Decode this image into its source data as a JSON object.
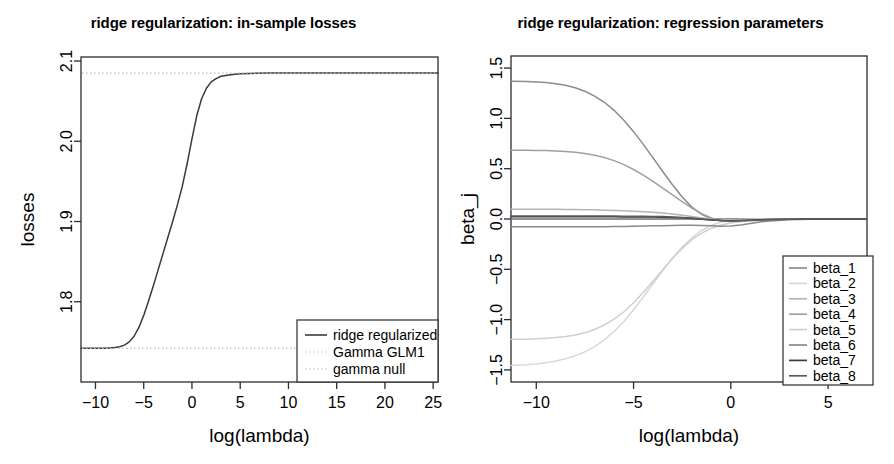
{
  "figure": {
    "background": "#ffffff",
    "foreground": "#000000",
    "panels": 2
  },
  "left_panel": {
    "title": "ridge regularization: in-sample losses",
    "xlabel": "log(lambda)",
    "ylabel": "losses",
    "legend": {
      "items": [
        {
          "label": "ridge regularized",
          "style": "solid",
          "color": "#3a3a3a"
        },
        {
          "label": "Gamma GLM1",
          "style": "dotted",
          "color": "#bdbdbd"
        },
        {
          "label": "gamma null",
          "style": "dotted",
          "color": "#bdbdbd"
        }
      ]
    }
  },
  "right_panel": {
    "title": "ridge regularization: regression parameters",
    "xlabel": "log(lambda)",
    "ylabel": "beta_j",
    "legend": {
      "items": [
        {
          "label": "beta_1",
          "color": "#8c8c8c"
        },
        {
          "label": "beta_2",
          "color": "#d8d8d8"
        },
        {
          "label": "beta_3",
          "color": "#b4b4b4"
        },
        {
          "label": "beta_4",
          "color": "#a0a0a0"
        },
        {
          "label": "beta_5",
          "color": "#cfcfcf"
        },
        {
          "label": "beta_6",
          "color": "#8a8a8a"
        },
        {
          "label": "beta_7",
          "color": "#3c3c3c"
        },
        {
          "label": "beta_8",
          "color": "#5a5a5a"
        }
      ]
    }
  },
  "chart_data": [
    {
      "id": "in-sample-losses",
      "type": "line",
      "title": "ridge regularization: in-sample losses",
      "xlabel": "log(lambda)",
      "ylabel": "losses",
      "grid": false,
      "legend_position": "bottom-right",
      "xlim": [
        -11.5,
        25.5
      ],
      "ylim": [
        1.7,
        2.105
      ],
      "xticks": [
        -10,
        -5,
        0,
        5,
        10,
        15,
        20,
        25
      ],
      "yticks": [
        1.8,
        1.9,
        2.0,
        2.1
      ],
      "ytick_labels": [
        "1.8",
        "1.9",
        "2.0",
        "2.1"
      ],
      "xtick_labels": [
        "-10",
        "-5",
        "0",
        "5",
        "10",
        "15",
        "20",
        "25"
      ],
      "series": [
        {
          "name": "ridge regularized",
          "style": "solid",
          "color": "#3a3a3a",
          "x": [
            -11.5,
            -11.0,
            -10.5,
            -10.0,
            -9.5,
            -9.0,
            -8.5,
            -8.0,
            -7.5,
            -7.0,
            -6.5,
            -6.0,
            -5.5,
            -5.0,
            -4.5,
            -4.0,
            -3.5,
            -3.0,
            -2.5,
            -2.0,
            -1.5,
            -1.0,
            -0.5,
            0.0,
            0.5,
            1.0,
            1.5,
            2.0,
            2.5,
            3.0,
            3.5,
            4.0,
            5.0,
            6.0,
            8.0,
            10.0,
            14.0,
            18.0,
            22.0,
            25.5
          ],
          "y": [
            1.742,
            1.742,
            1.742,
            1.742,
            1.742,
            1.742,
            1.7425,
            1.743,
            1.744,
            1.746,
            1.75,
            1.757,
            1.768,
            1.783,
            1.801,
            1.82,
            1.84,
            1.86,
            1.88,
            1.9,
            1.921,
            1.944,
            1.972,
            2.003,
            2.032,
            2.053,
            2.066,
            2.074,
            2.078,
            2.081,
            2.082,
            2.083,
            2.084,
            2.0845,
            2.085,
            2.085,
            2.085,
            2.085,
            2.085,
            2.085
          ]
        },
        {
          "name": "Gamma GLM1",
          "style": "dotted",
          "color": "#bdbdbd",
          "constant_y": 1.742,
          "description": "horizontal dotted reference line at lower asymptote"
        },
        {
          "name": "gamma null",
          "style": "dotted",
          "color": "#bdbdbd",
          "constant_y": 2.085,
          "description": "horizontal dotted reference line at upper asymptote"
        }
      ]
    },
    {
      "id": "regression-parameters",
      "type": "line",
      "title": "ridge regularization: regression parameters",
      "xlabel": "log(lambda)",
      "ylabel": "beta_j",
      "grid": false,
      "legend_position": "bottom-right",
      "xlim": [
        -11.3,
        7.0
      ],
      "ylim": [
        -1.62,
        1.62
      ],
      "xticks": [
        -10,
        -5,
        0,
        5
      ],
      "xtick_labels": [
        "-10",
        "-5",
        "0",
        "5"
      ],
      "yticks": [
        -1.5,
        -1.0,
        -0.5,
        0.0,
        0.5,
        1.0,
        1.5
      ],
      "ytick_labels": [
        "-1.5",
        "-1.0",
        "-0.5",
        "0.0",
        "0.5",
        "1.0",
        "1.5"
      ],
      "zero_line": true,
      "x": [
        -11.3,
        -10.5,
        -10.0,
        -9.5,
        -9.0,
        -8.5,
        -8.0,
        -7.5,
        -7.0,
        -6.5,
        -6.0,
        -5.5,
        -5.0,
        -4.5,
        -4.0,
        -3.5,
        -3.0,
        -2.5,
        -2.0,
        -1.5,
        -1.0,
        -0.5,
        0.0,
        0.5,
        1.0,
        1.5,
        2.0,
        3.0,
        4.0,
        5.0,
        6.0,
        7.0
      ],
      "series": [
        {
          "name": "beta_1",
          "color": "#8c8c8c",
          "values": [
            1.368,
            1.366,
            1.362,
            1.356,
            1.345,
            1.33,
            1.305,
            1.27,
            1.222,
            1.16,
            1.08,
            0.982,
            0.868,
            0.742,
            0.608,
            0.472,
            0.34,
            0.218,
            0.118,
            0.046,
            0.002,
            -0.018,
            -0.022,
            -0.018,
            -0.012,
            -0.007,
            -0.004,
            -0.001,
            0.0,
            0.0,
            0.0,
            0.0
          ]
        },
        {
          "name": "beta_2",
          "color": "#d8d8d8",
          "values": [
            -1.455,
            -1.448,
            -1.44,
            -1.428,
            -1.412,
            -1.39,
            -1.36,
            -1.32,
            -1.268,
            -1.2,
            -1.118,
            -1.018,
            -0.902,
            -0.776,
            -0.644,
            -0.512,
            -0.388,
            -0.278,
            -0.186,
            -0.114,
            -0.062,
            -0.03,
            -0.013,
            -0.005,
            -0.002,
            -0.001,
            0.0,
            0.0,
            0.0,
            0.0,
            0.0,
            0.0
          ]
        },
        {
          "name": "beta_3",
          "color": "#b4b4b4",
          "values": [
            0.096,
            0.096,
            0.096,
            0.096,
            0.096,
            0.095,
            0.094,
            0.093,
            0.091,
            0.088,
            0.085,
            0.081,
            0.077,
            0.072,
            0.066,
            0.059,
            0.05,
            0.038,
            0.024,
            0.01,
            -0.002,
            -0.009,
            -0.011,
            -0.009,
            -0.006,
            -0.004,
            -0.002,
            -0.001,
            0.0,
            0.0,
            0.0,
            0.0
          ]
        },
        {
          "name": "beta_4",
          "color": "#a0a0a0",
          "values": [
            0.684,
            0.683,
            0.682,
            0.68,
            0.676,
            0.671,
            0.663,
            0.651,
            0.634,
            0.611,
            0.58,
            0.54,
            0.492,
            0.436,
            0.374,
            0.308,
            0.24,
            0.172,
            0.108,
            0.052,
            0.01,
            -0.016,
            -0.026,
            -0.024,
            -0.018,
            -0.012,
            -0.007,
            -0.002,
            -0.001,
            0.0,
            0.0,
            0.0
          ]
        },
        {
          "name": "beta_5",
          "color": "#cfcfcf",
          "values": [
            -1.196,
            -1.194,
            -1.19,
            -1.186,
            -1.178,
            -1.168,
            -1.152,
            -1.13,
            -1.098,
            -1.054,
            -0.996,
            -0.922,
            -0.832,
            -0.73,
            -0.618,
            -0.504,
            -0.392,
            -0.292,
            -0.206,
            -0.14,
            -0.092,
            -0.06,
            -0.04,
            -0.026,
            -0.016,
            -0.01,
            -0.006,
            -0.002,
            -0.001,
            0.0,
            0.0,
            0.0
          ]
        },
        {
          "name": "beta_6",
          "color": "#8a8a8a",
          "values": [
            -0.078,
            -0.078,
            -0.078,
            -0.078,
            -0.078,
            -0.078,
            -0.078,
            -0.077,
            -0.077,
            -0.076,
            -0.075,
            -0.074,
            -0.072,
            -0.07,
            -0.068,
            -0.066,
            -0.064,
            -0.062,
            -0.062,
            -0.064,
            -0.068,
            -0.072,
            -0.07,
            -0.06,
            -0.044,
            -0.03,
            -0.019,
            -0.008,
            -0.003,
            -0.001,
            0.0,
            0.0
          ]
        },
        {
          "name": "beta_7",
          "color": "#3c3c3c",
          "values": [
            0.022,
            0.022,
            0.022,
            0.022,
            0.022,
            0.022,
            0.022,
            0.022,
            0.022,
            0.022,
            0.022,
            0.021,
            0.021,
            0.02,
            0.019,
            0.018,
            0.016,
            0.012,
            0.006,
            -0.002,
            -0.01,
            -0.016,
            -0.018,
            -0.016,
            -0.012,
            -0.008,
            -0.005,
            -0.002,
            -0.001,
            0.0,
            0.0,
            0.0
          ]
        },
        {
          "name": "beta_8",
          "color": "#5a5a5a",
          "values": [
            0.03,
            0.03,
            0.03,
            0.03,
            0.03,
            0.03,
            0.03,
            0.03,
            0.029,
            0.029,
            0.029,
            0.028,
            0.028,
            0.027,
            0.026,
            0.024,
            0.021,
            0.016,
            0.009,
            0.0,
            -0.009,
            -0.016,
            -0.019,
            -0.017,
            -0.013,
            -0.009,
            -0.005,
            -0.002,
            -0.001,
            0.0,
            0.0,
            0.0
          ]
        }
      ]
    }
  ]
}
